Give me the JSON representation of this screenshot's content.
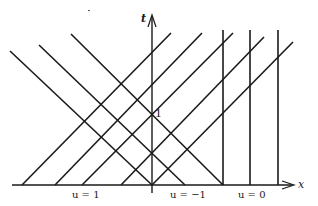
{
  "diagram": {
    "type": "characteristics",
    "axes": {
      "x_label": "x",
      "t_label": "t",
      "t_tick": "1"
    },
    "regions": [
      {
        "label": "u = 1"
      },
      {
        "label": "u = −1"
      },
      {
        "label": "u = 0"
      }
    ],
    "stroke_color": "#1a1a1a",
    "lines": {
      "right_moving": [
        [
          22,
          185,
          171,
          33
        ],
        [
          55,
          185,
          202,
          33
        ],
        [
          82,
          185,
          233,
          33
        ],
        [
          121,
          185,
          264,
          37
        ],
        [
          152,
          185,
          293,
          42
        ]
      ],
      "left_moving": [
        [
          10,
          51,
          152,
          185
        ],
        [
          39,
          45,
          185,
          185
        ],
        [
          71,
          34,
          223,
          185
        ]
      ],
      "vertical": [
        [
          223,
          30,
          223,
          185
        ],
        [
          250,
          30,
          250,
          185
        ],
        [
          278,
          30,
          278,
          185
        ]
      ]
    }
  }
}
